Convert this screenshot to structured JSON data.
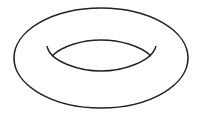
{
  "figure": {
    "stroke_color": "#222222",
    "background_color": "#ffffff"
  }
}
